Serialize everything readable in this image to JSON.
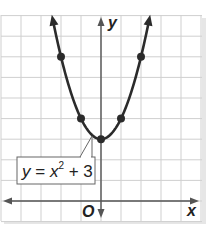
{
  "chart_data": {
    "type": "line",
    "title": "",
    "equation": {
      "y_part": "y",
      "equals": " = ",
      "x_part": "x",
      "exponent": "2",
      "rest": " + 3"
    },
    "xlabel": "x",
    "ylabel": "y",
    "origin_label": "O",
    "xlim": [
      -5,
      5
    ],
    "ylim": [
      -1,
      9
    ],
    "grid": true,
    "series": [
      {
        "name": "y = x^2 + 3",
        "function": "x^2 + 3",
        "domain": [
          -2.4,
          2.4
        ]
      }
    ],
    "points": [
      {
        "x": -2,
        "y": 7
      },
      {
        "x": -1,
        "y": 4
      },
      {
        "x": 0,
        "y": 3
      },
      {
        "x": 1,
        "y": 4
      },
      {
        "x": 2,
        "y": 7
      }
    ],
    "colors": {
      "curve": "#2b2b2b",
      "grid": "#cfcfcf",
      "axis": "#555555",
      "label_border": "#666666"
    }
  }
}
